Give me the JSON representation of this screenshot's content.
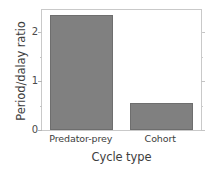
{
  "chart_data": {
    "type": "bar",
    "title": "",
    "subtitle": "",
    "xlabel": "Cycle type",
    "ylabel": "Period/dalay ratio",
    "categories": [
      "Predator-prey",
      "Cohort"
    ],
    "values": [
      2.35,
      0.55
    ],
    "series": [
      {
        "name": "Period/dalay ratio",
        "values": [
          2.35,
          0.55
        ]
      }
    ],
    "ylim": [
      0,
      2.45
    ],
    "xlim": [
      0,
      2
    ],
    "y_ticks": [
      0,
      1,
      2
    ],
    "y_tick_labels": [
      "0",
      "1",
      "2"
    ],
    "y_minor_ticks": [
      0.5,
      1.5,
      2.0
    ],
    "grid": false,
    "legend": null,
    "legend_position": "none",
    "bar_color": "#808080",
    "bar_edge_color": "#6e6e6e",
    "frame_color": "#c9c9c9",
    "background_color": "#ffffff",
    "text_color": "#3d3d3d",
    "annotations": []
  }
}
